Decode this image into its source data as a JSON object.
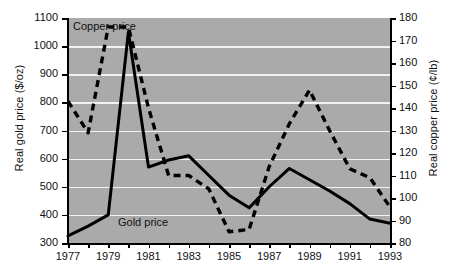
{
  "chart_data": {
    "type": "line",
    "title": "",
    "xlabel": "",
    "x": [
      1977,
      1978,
      1979,
      1980,
      1981,
      1982,
      1983,
      1984,
      1985,
      1986,
      1987,
      1988,
      1989,
      1990,
      1991,
      1992,
      1993
    ],
    "xlim": [
      1977,
      1993
    ],
    "xticks": [
      1977,
      1979,
      1981,
      1983,
      1985,
      1987,
      1989,
      1991,
      1993
    ],
    "xticklabels": [
      "1977",
      "1979",
      "1981",
      "1983",
      "1985",
      "1987",
      "1989",
      "1991",
      "1993"
    ],
    "grid": true,
    "legend_position": "inline-annotation",
    "axes": [
      {
        "id": "left",
        "ylabel": "Real gold price ($/oz)",
        "ylim": [
          300,
          1100
        ],
        "yticks": [
          300,
          400,
          500,
          600,
          700,
          800,
          900,
          1000,
          1100
        ],
        "yticklabels": [
          "300",
          "400",
          "500",
          "600",
          "700",
          "800",
          "900",
          "1000",
          "1100"
        ]
      },
      {
        "id": "right",
        "ylabel": "Real copper price (¢/lb)",
        "ylim": [
          80,
          180
        ],
        "yticks": [
          80,
          90,
          100,
          110,
          120,
          130,
          140,
          150,
          160,
          170,
          180
        ],
        "yticklabels": [
          "80",
          "90",
          "100",
          "110",
          "120",
          "130",
          "140",
          "150",
          "160",
          "170",
          "180"
        ]
      }
    ],
    "series": [
      {
        "name": "Gold price",
        "axis": "left",
        "style": "solid",
        "color": "#000000",
        "annotation": "Gold price",
        "values": [
          325,
          360,
          400,
          1050,
          570,
          595,
          610,
          540,
          470,
          425,
          500,
          565,
          525,
          485,
          440,
          385,
          370
        ]
      },
      {
        "name": "Copper price",
        "axis": "right",
        "style": "dashed",
        "color": "#000000",
        "annotation": "Copper price",
        "values": [
          143,
          129,
          176,
          176,
          140,
          110,
          110,
          104,
          85,
          86,
          114,
          133,
          148,
          130,
          113,
          109,
          96
        ]
      }
    ]
  }
}
